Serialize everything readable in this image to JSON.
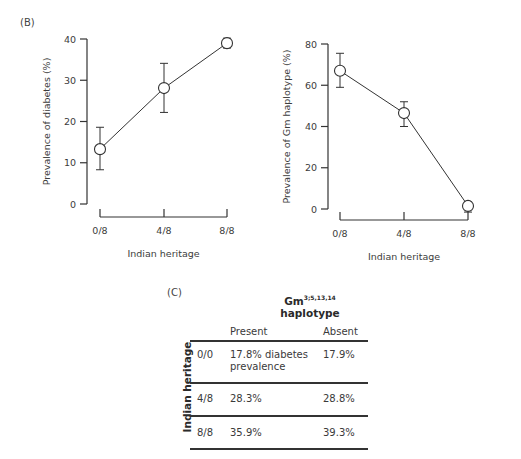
{
  "panels": {
    "B_label": "(B)",
    "C_label": "(C)"
  },
  "chart_data": [
    {
      "type": "line",
      "title": "",
      "xlabel": "Indian heritage",
      "ylabel": "Prevalence of diabetes (%)",
      "categories": [
        "0/8",
        "4/8",
        "8/8"
      ],
      "values": [
        13.3,
        28.1,
        39.0
      ],
      "error_low": [
        8.3,
        22.2,
        37.8
      ],
      "error_high": [
        18.6,
        34.1,
        40.2
      ],
      "yticks": [
        0,
        10,
        20,
        30,
        40
      ],
      "ylim": [
        0,
        40
      ],
      "grid": false,
      "marker": "open-circle"
    },
    {
      "type": "line",
      "title": "",
      "xlabel": "Indian heritage",
      "ylabel": "Prevalence of Gm haplotype (%)",
      "categories": [
        "0/8",
        "4/8",
        "8/8"
      ],
      "values": [
        67.0,
        46.5,
        1.5
      ],
      "error_low": [
        59.0,
        40.0,
        -1.5
      ],
      "error_high": [
        75.5,
        52.0,
        3.5
      ],
      "yticks": [
        0,
        20,
        40,
        60,
        80
      ],
      "ylim": [
        0,
        80
      ],
      "grid": false,
      "marker": "open-circle"
    },
    {
      "type": "table",
      "title": "Gm3;5,13,14 haplotype",
      "column_group_title": "Gm",
      "column_group_superscript": "3;5,13,14",
      "column_group_subtitle": "haplotype",
      "row_group_title": "Indian heritage",
      "columns": [
        "Present",
        "Absent"
      ],
      "rows": [
        {
          "label": "0/0",
          "present": "17.8% diabetes prevalence",
          "absent": "17.9%"
        },
        {
          "label": "4/8",
          "present": "28.3%",
          "absent": "28.8%"
        },
        {
          "label": "8/8",
          "present": "35.9%",
          "absent": "39.3%"
        }
      ]
    }
  ],
  "table": {
    "group_title": "Gm",
    "group_sup": "3;5,13,14",
    "group_subtitle": "haplotype",
    "row_group_title": "Indian heritage",
    "col_present": "Present",
    "col_absent": "Absent",
    "rows": [
      {
        "label": "0/0",
        "present_line1": "17.8% diabetes",
        "present_line2": "prevalence",
        "absent": "17.9%"
      },
      {
        "label": "4/8",
        "present_line1": "28.3%",
        "present_line2": "",
        "absent": "28.8%"
      },
      {
        "label": "8/8",
        "present_line1": "35.9%",
        "present_line2": "",
        "absent": "39.3%"
      }
    ]
  }
}
